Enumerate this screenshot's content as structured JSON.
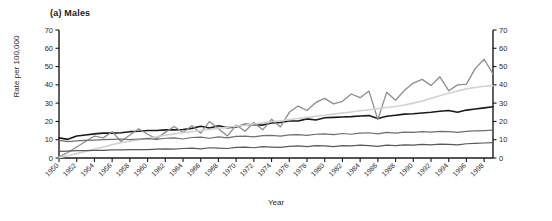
{
  "figure": {
    "panel_title": "(a) Males",
    "xlabel": "Year",
    "ylabel": "Rate per 100,000"
  },
  "chart_data": {
    "type": "line",
    "title": "(a) Males",
    "xlabel": "Year",
    "ylabel": "Rate per 100,000",
    "xlim": [
      1950,
      1999
    ],
    "ylim": [
      0,
      70
    ],
    "yticks": [
      0,
      10,
      20,
      30,
      40,
      50,
      60,
      70
    ],
    "y_axis_right": {
      "ticks": [
        0,
        10,
        20,
        30,
        40,
        50,
        60,
        70
      ],
      "label": ""
    },
    "grid": false,
    "legend": "none",
    "xticks": [
      1950,
      1952,
      1954,
      1956,
      1958,
      1960,
      1962,
      1964,
      1966,
      1968,
      1970,
      1972,
      1974,
      1976,
      1978,
      1980,
      1982,
      1984,
      1986,
      1988,
      1990,
      1992,
      1994,
      1996,
      1998
    ],
    "x": [
      1950,
      1951,
      1952,
      1953,
      1954,
      1955,
      1956,
      1957,
      1958,
      1959,
      1960,
      1961,
      1962,
      1963,
      1964,
      1965,
      1966,
      1967,
      1968,
      1969,
      1970,
      1971,
      1972,
      1973,
      1974,
      1975,
      1976,
      1977,
      1978,
      1979,
      1980,
      1981,
      1982,
      1983,
      1984,
      1985,
      1986,
      1987,
      1988,
      1989,
      1990,
      1991,
      1992,
      1993,
      1994,
      1995,
      1996,
      1997,
      1998,
      1999
    ],
    "series": [
      {
        "name": "series-1-dark",
        "color": "#1a1a1a",
        "width": 1.6,
        "values": [
          11.0,
          10.2,
          12.0,
          12.6,
          13.2,
          13.6,
          13.6,
          13.8,
          14.4,
          14.6,
          15.0,
          15.0,
          15.4,
          15.4,
          15.6,
          16.2,
          17.4,
          16.4,
          17.6,
          16.6,
          17.0,
          18.4,
          18.2,
          18.0,
          19.2,
          19.4,
          20.2,
          20.2,
          21.4,
          20.8,
          22.0,
          22.2,
          22.4,
          22.6,
          23.0,
          23.2,
          21.6,
          22.8,
          23.4,
          24.0,
          24.2,
          24.6,
          25.0,
          25.6,
          26.0,
          25.0,
          26.2,
          26.8,
          27.4,
          28.0
        ]
      },
      {
        "name": "series-2-jagged-gray",
        "color": "#8c8c8c",
        "width": 1.3,
        "values": [
          0.6,
          3.0,
          6.0,
          9.0,
          12.0,
          11.0,
          14.4,
          9.0,
          12.6,
          16.0,
          13.0,
          10.6,
          14.0,
          17.2,
          14.0,
          17.6,
          13.6,
          20.0,
          16.0,
          12.0,
          18.0,
          14.6,
          19.4,
          15.4,
          21.2,
          17.0,
          25.0,
          28.4,
          26.0,
          30.4,
          32.6,
          29.6,
          31.0,
          35.0,
          33.0,
          36.6,
          21.0,
          36.0,
          31.6,
          37.0,
          41.0,
          43.0,
          39.6,
          44.4,
          36.8,
          40.0,
          40.4,
          49.0,
          54.0,
          46.0
        ]
      },
      {
        "name": "series-3-light-gray",
        "color": "#d2d2d2",
        "width": 1.6,
        "values": [
          0.2,
          1.2,
          2.4,
          3.6,
          4.8,
          6.0,
          7.2,
          8.4,
          9.2,
          10.0,
          10.8,
          11.6,
          12.4,
          13.2,
          13.8,
          14.4,
          15.0,
          15.6,
          16.2,
          16.8,
          17.4,
          18.0,
          18.6,
          19.2,
          19.8,
          20.4,
          21.0,
          21.6,
          22.2,
          22.8,
          23.4,
          24.0,
          24.6,
          25.2,
          25.8,
          26.4,
          27.0,
          27.6,
          28.2,
          29.0,
          30.0,
          31.2,
          32.6,
          34.0,
          35.4,
          36.6,
          37.8,
          38.6,
          39.2,
          39.6
        ]
      },
      {
        "name": "series-4-mid-gray",
        "color": "#6e6e6e",
        "width": 1.2,
        "values": [
          9.6,
          9.0,
          9.4,
          9.6,
          9.8,
          10.0,
          10.2,
          10.4,
          10.0,
          10.4,
          10.6,
          10.2,
          10.8,
          11.0,
          10.4,
          11.2,
          11.4,
          10.8,
          11.6,
          11.0,
          11.8,
          12.0,
          11.6,
          12.2,
          12.4,
          12.0,
          12.6,
          12.8,
          12.4,
          13.0,
          13.2,
          12.8,
          13.4,
          13.0,
          13.6,
          13.8,
          13.2,
          14.0,
          13.6,
          14.2,
          14.0,
          14.4,
          14.2,
          14.6,
          14.4,
          14.0,
          14.6,
          14.8,
          15.0,
          15.2
        ]
      },
      {
        "name": "series-5-low-gray",
        "color": "#595959",
        "width": 1.2,
        "values": [
          3.6,
          3.8,
          4.0,
          4.0,
          4.2,
          4.2,
          4.4,
          4.4,
          4.6,
          4.6,
          4.6,
          4.8,
          5.0,
          4.8,
          5.2,
          5.4,
          5.0,
          5.6,
          5.4,
          5.2,
          5.8,
          6.0,
          5.6,
          6.2,
          6.0,
          5.8,
          6.4,
          6.6,
          6.2,
          6.8,
          6.6,
          6.2,
          6.8,
          6.6,
          7.0,
          6.8,
          6.4,
          7.0,
          6.8,
          7.2,
          7.0,
          7.4,
          7.2,
          7.6,
          7.4,
          7.2,
          7.8,
          8.0,
          8.2,
          8.4
        ]
      }
    ]
  }
}
